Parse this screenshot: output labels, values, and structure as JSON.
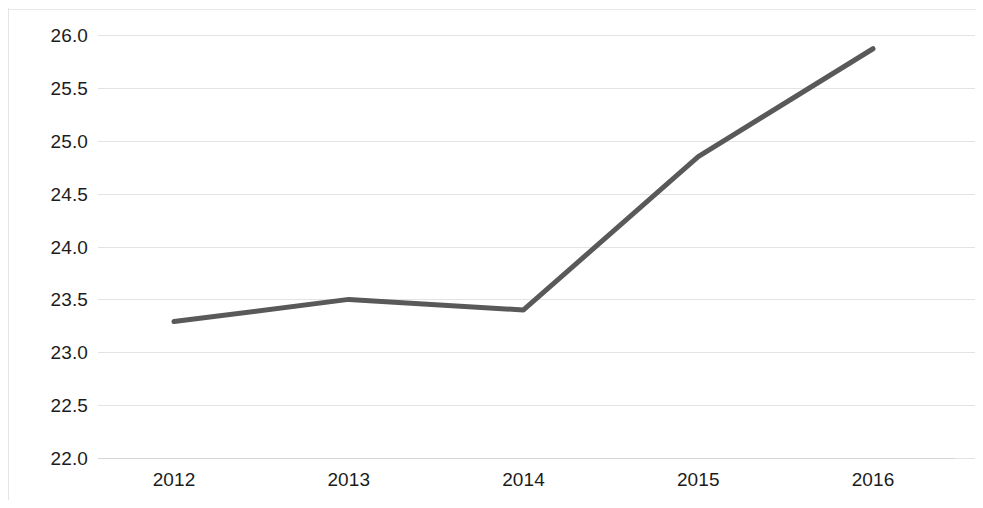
{
  "chart_data": {
    "type": "line",
    "title": "",
    "subtitle": "",
    "xlabel": "",
    "ylabel": "",
    "categories": [
      "2012",
      "2013",
      "2014",
      "2015",
      "2016"
    ],
    "x": [
      2012,
      2013,
      2014,
      2015,
      2016
    ],
    "values": [
      23.29,
      23.5,
      23.4,
      24.85,
      25.87
    ],
    "series": [
      {
        "name": "",
        "values": [
          23.29,
          23.5,
          23.4,
          24.85,
          25.87
        ]
      }
    ],
    "ylim": [
      22.0,
      26.0
    ],
    "y_ticks": [
      "26.0",
      "25.5",
      "25.0",
      "24.5",
      "24.0",
      "23.5",
      "23.0",
      "22.5",
      "22.0"
    ],
    "y_tick_values": [
      26.0,
      25.5,
      25.0,
      24.5,
      24.0,
      23.5,
      23.0,
      22.5,
      22.0
    ],
    "x_ticks": [
      "2012",
      "2013",
      "2014",
      "2015",
      "2016"
    ],
    "grid": true,
    "grid_axis": "y",
    "legend": false,
    "legend_position": "none",
    "line_color": "#595959",
    "line_width": 5,
    "markers": false,
    "grid_color": "#dededf",
    "axis_color": "#d6d6d6",
    "text_color": "#1c1c1c",
    "background_color": "#ffffff",
    "annotations": []
  }
}
